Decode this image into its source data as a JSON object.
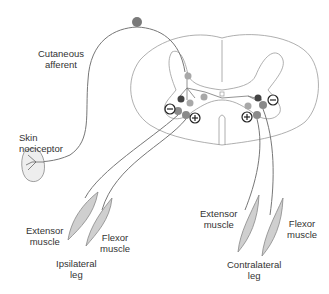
{
  "labels": {
    "cutaneous_afferent": [
      "Cutaneous",
      "afferent"
    ],
    "skin_nociceptor": [
      "Skin",
      "nociceptor"
    ],
    "ipsi_extensor": [
      "Extensor",
      "muscle"
    ],
    "ipsi_flexor": [
      "Flexor",
      "muscle"
    ],
    "ipsi_leg": [
      "Ipsilateral",
      "leg"
    ],
    "contra_extensor": [
      "Extensor",
      "muscle"
    ],
    "contra_flexor": [
      "Flexor",
      "muscle"
    ],
    "contra_leg": [
      "Contralateral",
      "leg"
    ]
  },
  "signs": {
    "excitatory": "+",
    "inhibitory": "−"
  },
  "colors": {
    "line": "#777777",
    "outline": "#9a9a9a",
    "neuron_light": "#a8a8a8",
    "neuron_mid": "#8a8a8a",
    "neuron_dark": "#444444",
    "muscle_fill": "#cfcfcf",
    "soma": "#7a7a7a"
  }
}
